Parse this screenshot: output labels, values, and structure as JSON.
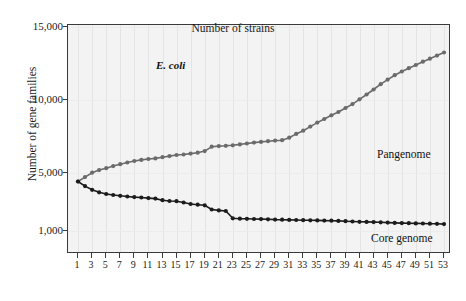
{
  "chart_data": {
    "type": "line",
    "title": "",
    "annotation": "E. coli",
    "xlabel": "Number of strains",
    "ylabel": "Number of gene families",
    "xlim": [
      1,
      53
    ],
    "ylim": [
      1000,
      15000
    ],
    "grid": "faint-vertical",
    "legend_position": "inline-labels",
    "xticks": [
      1,
      3,
      5,
      7,
      9,
      11,
      13,
      15,
      17,
      19,
      21,
      23,
      25,
      27,
      29,
      31,
      33,
      35,
      37,
      39,
      41,
      43,
      45,
      47,
      49,
      51,
      53
    ],
    "xticklabels": [
      "1",
      "3",
      "5",
      "7",
      "9",
      "11",
      "13",
      "15",
      "17",
      "19",
      "21",
      "23",
      "25",
      "27",
      "29",
      "31",
      "33",
      "35",
      "37",
      "39",
      "41",
      "43",
      "45",
      "47",
      "49",
      "51",
      "53"
    ],
    "yticks": [
      1000,
      5000,
      10000,
      15000
    ],
    "yticklabels": [
      "1,000",
      "5,000",
      "10,000",
      "15,000"
    ],
    "x": [
      1,
      2,
      3,
      4,
      5,
      6,
      7,
      8,
      9,
      10,
      11,
      12,
      13,
      14,
      15,
      16,
      17,
      18,
      19,
      20,
      21,
      22,
      23,
      24,
      25,
      26,
      27,
      28,
      29,
      30,
      31,
      32,
      33,
      34,
      35,
      36,
      37,
      38,
      39,
      40,
      41,
      42,
      43,
      44,
      45,
      46,
      47,
      48,
      49,
      50,
      51,
      52,
      53
    ],
    "series": [
      {
        "name": "Pangenome",
        "color": "#6b6b6b",
        "marker": "circle",
        "label_x": 31,
        "label_y": 7900,
        "values": [
          4420,
          4720,
          5020,
          5200,
          5330,
          5470,
          5600,
          5720,
          5820,
          5900,
          5960,
          6000,
          6080,
          6160,
          6230,
          6270,
          6330,
          6390,
          6500,
          6800,
          6840,
          6860,
          6900,
          6960,
          7020,
          7080,
          7130,
          7180,
          7220,
          7250,
          7420,
          7680,
          7900,
          8180,
          8450,
          8700,
          8950,
          9180,
          9450,
          9720,
          10050,
          10380,
          10720,
          11080,
          11400,
          11700,
          11950,
          12180,
          12400,
          12620,
          12830,
          13040,
          13250
        ]
      },
      {
        "name": "Core genome",
        "color": "#1c1c1c",
        "marker": "circle",
        "label_x": 30,
        "label_y": 2380,
        "values": [
          4420,
          4100,
          3850,
          3680,
          3560,
          3490,
          3440,
          3390,
          3350,
          3320,
          3280,
          3250,
          3140,
          3080,
          3070,
          2980,
          2880,
          2830,
          2790,
          2500,
          2440,
          2400,
          1900,
          1870,
          1860,
          1850,
          1840,
          1830,
          1810,
          1800,
          1790,
          1780,
          1770,
          1760,
          1750,
          1740,
          1730,
          1720,
          1700,
          1680,
          1660,
          1650,
          1640,
          1620,
          1600,
          1580,
          1570,
          1560,
          1550,
          1540,
          1530,
          1520,
          1500
        ]
      }
    ]
  }
}
